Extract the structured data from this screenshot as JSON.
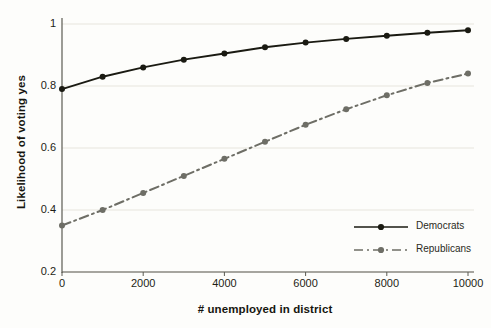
{
  "chart_data": {
    "type": "line",
    "title": "",
    "subtitle": "",
    "xlabel": "# unemployed in district",
    "ylabel": "Likelihood of voting yes",
    "xlim": [
      0,
      10000
    ],
    "ylim": [
      0.2,
      1.0
    ],
    "xticks": [
      0,
      2000,
      4000,
      6000,
      8000,
      10000
    ],
    "xtick_labels": [
      "0",
      "2000",
      "4000",
      "6000",
      "8000",
      "10000"
    ],
    "yticks": [
      0.2,
      0.4,
      0.6,
      0.8,
      1.0
    ],
    "ytick_labels": [
      "0.2",
      "0.4",
      "0.6",
      "0.8",
      "1"
    ],
    "grid": "horizontal",
    "legend_position": "bottom-right",
    "x": [
      0,
      1000,
      2000,
      3000,
      4000,
      5000,
      6000,
      7000,
      8000,
      9000,
      10000
    ],
    "series": [
      {
        "name": "Democrats",
        "style": "solid",
        "color": "#1a1a12",
        "marker": "circle",
        "values": [
          0.79,
          0.83,
          0.86,
          0.885,
          0.905,
          0.925,
          0.94,
          0.952,
          0.962,
          0.972,
          0.98
        ]
      },
      {
        "name": "Republicans",
        "style": "dashed",
        "color": "#6e6e66",
        "marker": "circle",
        "values": [
          0.35,
          0.4,
          0.455,
          0.51,
          0.565,
          0.62,
          0.675,
          0.725,
          0.77,
          0.81,
          0.84
        ]
      }
    ]
  },
  "axes": {
    "grid_color": "#e7e5dd",
    "axis_color": "#5b5b52",
    "background": "#fdfdfb"
  },
  "legend": {
    "entries": [
      {
        "label": "Democrats"
      },
      {
        "label": "Republicans"
      }
    ]
  }
}
